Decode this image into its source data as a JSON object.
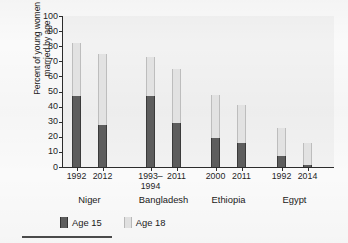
{
  "chart_data": {
    "type": "bar",
    "subtype": "grouped-overlay-stacked",
    "title": "",
    "xlabel": "",
    "ylabel": "Percent of young women\nmarried by age",
    "ylim": [
      0,
      100
    ],
    "ytick_step": 10,
    "yticks": [
      "100",
      "90",
      "80",
      "70",
      "60",
      "50",
      "40",
      "30",
      "20",
      "10",
      "0"
    ],
    "grid": false,
    "legend_position": "bottom-left",
    "series": [
      {
        "name": "Age 15",
        "color": "#5d5d5d",
        "values": [
          47,
          28,
          47,
          29,
          19,
          16,
          7,
          1
        ]
      },
      {
        "name": "Age 18",
        "color": "#e2e2e2",
        "values": [
          82,
          75,
          73,
          65,
          48,
          41,
          26,
          16
        ]
      }
    ],
    "categories": [
      "1992",
      "2012",
      "1993–\n1994",
      "2011",
      "2000",
      "2011",
      "1992",
      "2014"
    ],
    "groups": [
      {
        "label": "Niger",
        "categories": [
          "1992",
          "2012"
        ]
      },
      {
        "label": "Bangladesh",
        "categories": [
          "1993–\n1994",
          "2011"
        ]
      },
      {
        "label": "Ethiopia",
        "categories": [
          "2000",
          "2011"
        ]
      },
      {
        "label": "Egypt",
        "categories": [
          "1992",
          "2014"
        ]
      }
    ],
    "bars": [
      {
        "group": "Niger",
        "category": "1992",
        "age15": 47,
        "age18": 82
      },
      {
        "group": "Niger",
        "category": "2012",
        "age15": 28,
        "age18": 75
      },
      {
        "group": "Bangladesh",
        "category": "1993–\n1994",
        "age15": 47,
        "age18": 73
      },
      {
        "group": "Bangladesh",
        "category": "2011",
        "age15": 29,
        "age18": 65
      },
      {
        "group": "Ethiopia",
        "category": "2000",
        "age15": 19,
        "age18": 48
      },
      {
        "group": "Ethiopia",
        "category": "2011",
        "age15": 16,
        "age18": 41
      },
      {
        "group": "Egypt",
        "category": "1992",
        "age15": 7,
        "age18": 26
      },
      {
        "group": "Egypt",
        "category": "2014",
        "age15": 1,
        "age18": 16
      }
    ]
  },
  "legend": {
    "items": [
      {
        "label": "Age 15",
        "swatch": "dark"
      },
      {
        "label": "Age 18",
        "swatch": "light"
      }
    ]
  }
}
